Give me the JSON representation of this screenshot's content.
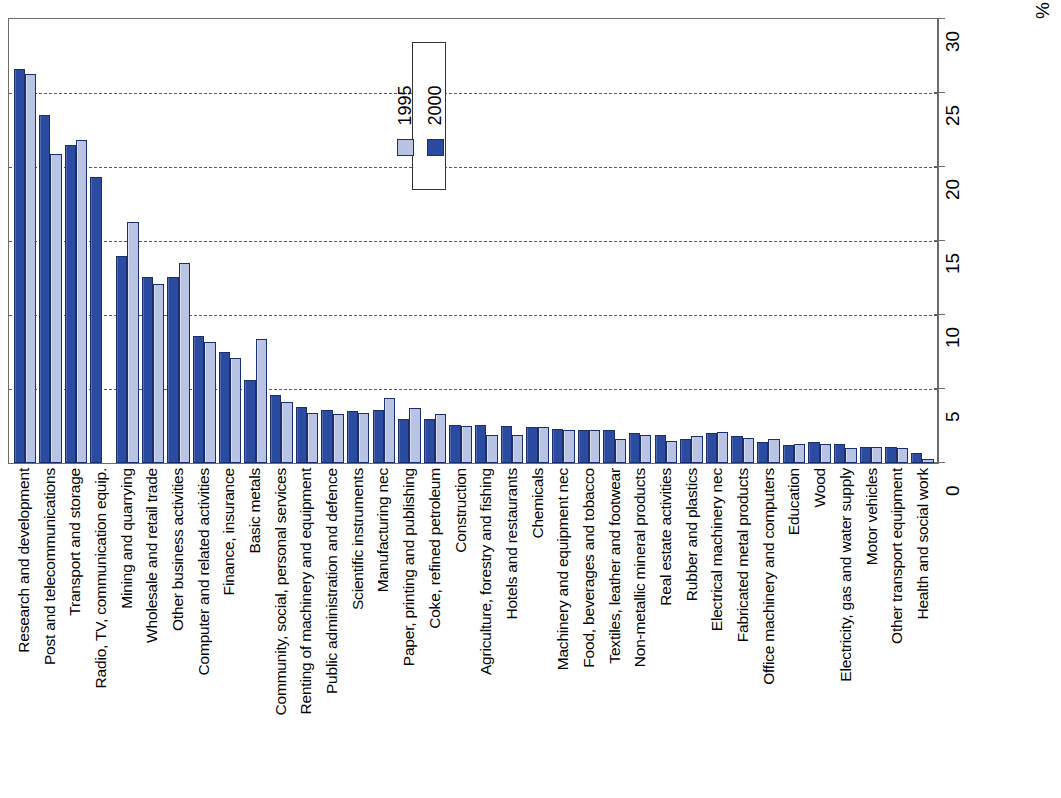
{
  "chart_data": {
    "type": "bar",
    "title": "",
    "subtitle": "",
    "xlabel": "",
    "ylabel": "%",
    "ylim": [
      0,
      30
    ],
    "yticks": [
      0,
      5,
      10,
      15,
      20,
      25,
      30
    ],
    "ytick_labels": [
      "0",
      "5",
      "10",
      "15",
      "20",
      "25",
      "30"
    ],
    "grid": true,
    "grid_axis": "y",
    "legend_position": "top-center-inside",
    "axis_position": "right",
    "orientation": "vertical-bars-rotated-labels",
    "categories": [
      "Research and development",
      "Post and telecommunications",
      "Transport and storage",
      "Radio, TV, communication equip.",
      "Mining and quarrying",
      "Wholesale and retail trade",
      "Other business activities",
      "Computer and related activities",
      "Finance, insurance",
      "Basic metals",
      "Community, social, personal services",
      "Renting of machinery and equipment",
      "Public administration and defence",
      "Scientific instruments",
      "Manufacturing nec",
      "Paper, printing and publishing",
      "Coke, refined petroleum",
      "Construction",
      "Agriculture, forestry and fishing",
      "Hotels and restaurants",
      "Chemicals",
      "Machinery and equipment nec",
      "Food, beverages and tobacco",
      "Textiles, leather and footwear",
      "Non-metallic mineral products",
      "Real estate activities",
      "Rubber and plastics",
      "Electrical machinery nec",
      "Fabricated metal products",
      "Office machinery and computers",
      "Education",
      "Wood",
      "Electricity, gas and water supply",
      "Motor vehicles",
      "Other transport equipment",
      "Health and social work"
    ],
    "series": [
      {
        "name": "2000",
        "color": "#2b4ba0",
        "values": [
          26.6,
          23.5,
          21.5,
          19.3,
          14.0,
          12.6,
          12.6,
          8.6,
          7.5,
          5.6,
          4.6,
          3.8,
          3.6,
          3.5,
          3.6,
          3.0,
          3.0,
          2.6,
          2.6,
          2.5,
          2.4,
          2.3,
          2.2,
          2.2,
          2.0,
          1.9,
          1.6,
          2.0,
          1.8,
          1.4,
          1.2,
          1.4,
          1.3,
          1.1,
          1.1,
          0.7
        ]
      },
      {
        "name": "1995",
        "color": "#b9c4e4",
        "values": [
          26.3,
          20.9,
          21.8,
          0.0,
          16.3,
          12.1,
          13.5,
          8.2,
          7.1,
          8.4,
          4.1,
          3.4,
          3.3,
          3.4,
          4.4,
          3.7,
          3.3,
          2.5,
          1.9,
          1.9,
          2.4,
          2.2,
          2.2,
          1.6,
          1.9,
          1.5,
          1.8,
          2.1,
          1.7,
          1.6,
          1.3,
          1.3,
          1.0,
          1.1,
          1.0,
          0.3
        ]
      }
    ]
  },
  "legend": {
    "entries": [
      {
        "label": "2000",
        "swatch": "dark-blue-swatch"
      },
      {
        "label": "1995",
        "swatch": "light-blue-swatch"
      }
    ]
  },
  "axis": {
    "unit_label": "%"
  }
}
